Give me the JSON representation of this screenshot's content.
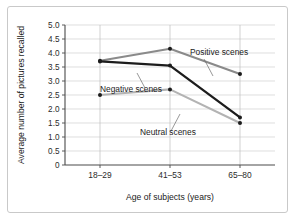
{
  "chart_data": {
    "type": "line",
    "title": "",
    "xlabel": "Age of subjects (years)",
    "ylabel": "Average number of pictures recalled",
    "categories": [
      "18–29",
      "41–53",
      "65–80"
    ],
    "ylim": [
      0,
      5.0
    ],
    "yticks": [
      "0",
      "0.5",
      "1.0",
      "1.5",
      "2.0",
      "2.5",
      "3.0",
      "3.5",
      "4.0",
      "4.5",
      "5.0"
    ],
    "ytick_values": [
      0,
      0.5,
      1.0,
      1.5,
      2.0,
      2.5,
      3.0,
      3.5,
      4.0,
      4.5,
      5.0
    ],
    "grid": "horizontal-and-vertical",
    "legend_position": "inline-annotations",
    "series": [
      {
        "name": "Positive scenes",
        "color": "#8a8a8a",
        "values": [
          3.72,
          4.15,
          3.25
        ]
      },
      {
        "name": "Negative scenes",
        "color": "#1c1c1c",
        "values": [
          3.7,
          3.55,
          1.7
        ]
      },
      {
        "name": "Neutral scenes",
        "color": "#b3b3b3",
        "values": [
          2.5,
          2.7,
          1.5
        ]
      }
    ],
    "annotations": [
      {
        "text": "Positive scenes",
        "series": "Positive scenes"
      },
      {
        "text": "Negative scenes",
        "series": "Negative scenes"
      },
      {
        "text": "Neutral scenes",
        "series": "Neutral scenes"
      }
    ]
  },
  "figure": {
    "background": "#ffffff",
    "border_color": "#c9c9c9",
    "axis_color": "#4a4a4a",
    "gridline_color": "#d0d0d0"
  }
}
